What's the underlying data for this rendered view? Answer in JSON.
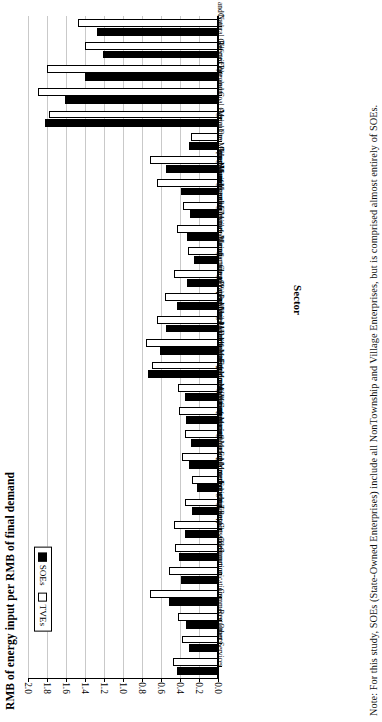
{
  "figure": {
    "value_axis_title": "RMB of energy input per RMB of final demand",
    "category_axis_title": "Sector",
    "note": "Note: For this study, SOEs (State-Owned Enterprises) include all NonTownship and Village Enterprises, but is comprised almost entirely of SOEs."
  },
  "legend": {
    "position": "top-left-inside",
    "items": [
      {
        "label": "TVEs",
        "swatch": "hollow-white-square"
      },
      {
        "label": "SOEs",
        "swatch": "filled-black-square"
      }
    ]
  },
  "chart_data": {
    "type": "bar",
    "orientation": "horizontal",
    "title": "",
    "subtitle": "",
    "xlabel": "Sector",
    "ylabel": "RMB of energy input per RMB of final demand",
    "ylim": [
      0.0,
      2.0
    ],
    "ytick_labels": [
      "0.0",
      "0.2",
      "0.4",
      "0.6",
      "0.8",
      "1.0",
      "1.2",
      "1.4",
      "1.6",
      "1.8",
      "2.0"
    ],
    "ytick_values": [
      0.0,
      0.2,
      0.4,
      0.6,
      0.8,
      1.0,
      1.2,
      1.4,
      1.6,
      1.8,
      2.0
    ],
    "grid": true,
    "legend_position": "inside top-left",
    "categories": [
      "Coal",
      "Crude Petroleum and Natural Gas",
      "Electricity",
      "Refined Petroleum",
      "Coke and Coal Gas",
      "Agriculture",
      "Metal Ore Mining",
      "Other Mining",
      "Food Manufacturing",
      "Manufacture of Textiles",
      "Apparels and Leather Manufacturing",
      "Sawmills and Furniture Manufacturing",
      "Manufacture of Paper",
      "Chemical Industries",
      "Building Material",
      "Primary Metal Manufacturing",
      "Metal Products Manufacturing",
      "Machinery Manufacturing",
      "Transport Equipment Manufacturing",
      "Electric Machinery Manufacturing",
      "Communication Equipment",
      "Instruments and Meters Manufacturing",
      "Maintenance and Repair",
      "Industries not Classified",
      "Construction",
      "Freight Transport and Communications",
      "Commerce",
      "Restaurants",
      "Other Services"
    ],
    "series": [
      {
        "name": "TVEs",
        "values": [
          1.47,
          1.4,
          1.8,
          1.89,
          1.78,
          0.28,
          0.72,
          0.64,
          0.37,
          0.43,
          0.32,
          0.46,
          0.56,
          0.64,
          0.76,
          0.69,
          0.42,
          0.41,
          0.35,
          0.38,
          0.27,
          0.35,
          0.46,
          0.45,
          0.52,
          0.72,
          0.42,
          0.38,
          0.47
        ]
      },
      {
        "name": "SOEs",
        "values": [
          1.27,
          1.21,
          1.4,
          1.61,
          1.82,
          0.31,
          0.55,
          0.39,
          0.29,
          0.33,
          0.25,
          0.33,
          0.43,
          0.55,
          0.61,
          0.74,
          0.35,
          0.34,
          0.28,
          0.31,
          0.22,
          0.27,
          0.35,
          0.41,
          0.39,
          0.52,
          0.34,
          0.31,
          0.43
        ]
      }
    ]
  }
}
